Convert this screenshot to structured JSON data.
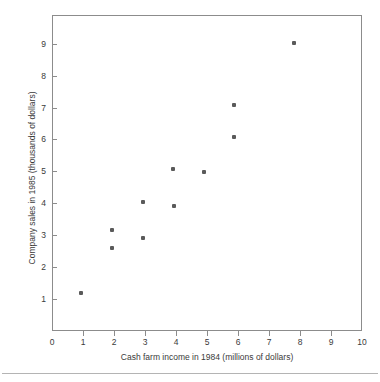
{
  "chart_data": {
    "type": "scatter",
    "title": "",
    "xlabel": "Cash farm income in 1984 (millions of dollars)",
    "ylabel": "Company sales in 1985 (thousands of dollars)",
    "xlim": [
      0,
      10
    ],
    "ylim": [
      0,
      9.9
    ],
    "grid": false,
    "legend": null,
    "xticks": [
      0,
      1,
      2,
      3,
      4,
      5,
      6,
      7,
      8,
      9,
      10
    ],
    "xtick_labels": [
      "0",
      "1",
      "2",
      "3",
      "4",
      "5",
      "6",
      "7",
      "8",
      "9",
      "10"
    ],
    "yticks": [
      1,
      2,
      3,
      4,
      5,
      6,
      7,
      8,
      9
    ],
    "ytick_labels": [
      "1",
      "2",
      "3",
      "4",
      "5",
      "6",
      "7",
      "8",
      "9"
    ],
    "marker_color": "#5a5a5a",
    "frame_color": "#8c8c8c",
    "points": [
      {
        "x": 0.94,
        "y": 1.2
      },
      {
        "x": 1.94,
        "y": 3.15
      },
      {
        "x": 1.94,
        "y": 2.6
      },
      {
        "x": 2.94,
        "y": 4.05
      },
      {
        "x": 2.94,
        "y": 2.92
      },
      {
        "x": 3.9,
        "y": 5.07
      },
      {
        "x": 3.92,
        "y": 3.92
      },
      {
        "x": 4.9,
        "y": 4.97
      },
      {
        "x": 5.87,
        "y": 7.07
      },
      {
        "x": 5.87,
        "y": 6.08
      },
      {
        "x": 7.8,
        "y": 9.02
      }
    ]
  },
  "axes": {
    "x_title": "Cash farm income in 1984 (millions of dollars)",
    "y_title": "Company sales in 1985 (thousands of dollars)"
  }
}
